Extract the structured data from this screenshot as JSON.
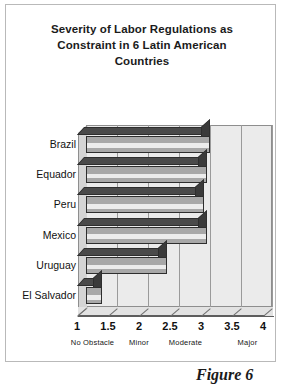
{
  "figure": {
    "caption": "Figure 6"
  },
  "chart_data": {
    "type": "bar",
    "orientation": "horizontal",
    "title": "Severity of Labor Regulations as Constraint in 6 Latin American Countries",
    "title_lines": [
      "Severity of Labor Regulations as",
      "Constraint in 6 Latin American",
      "Countries"
    ],
    "categories": [
      "Brazil",
      "Equador",
      "Peru",
      "Mexico",
      "Uruguay",
      "El Salvador"
    ],
    "values": [
      3.0,
      2.95,
      2.9,
      2.95,
      2.3,
      1.25
    ],
    "xlabel": "",
    "ylabel": "",
    "xlim": [
      1,
      4
    ],
    "xticks": [
      1,
      1.5,
      2,
      2.5,
      3,
      3.5,
      4
    ],
    "xtick_labels": [
      "1",
      "1.5",
      "2",
      "2.5",
      "3",
      "3.5",
      "4"
    ],
    "x_scale_labels": [
      {
        "label": "No Obstacle",
        "at": 1.25
      },
      {
        "label": "Minor",
        "at": 2.0
      },
      {
        "label": "Moderate",
        "at": 2.75
      },
      {
        "label": "Major",
        "at": 3.75
      }
    ],
    "grid": true,
    "legend": false,
    "style": "3d",
    "colors": {
      "bar_face": "#a8a8a8",
      "bar_top": "#4a4a4a",
      "bar_cap": "#3a3a3a",
      "plot_background": "#ebebeb",
      "gridline": "#9a9a9a",
      "axis": "#5d5d5d",
      "text": "#111111"
    }
  }
}
